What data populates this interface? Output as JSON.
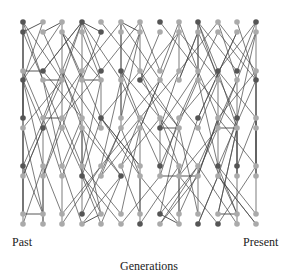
{
  "labels": {
    "past": "Past",
    "present": "Present",
    "axis": "Generations"
  },
  "colors": {
    "dark": "#555555",
    "light": "#aaaaaa",
    "edge": "#444444"
  },
  "columns_x": [
    23,
    43,
    62,
    82,
    101,
    121,
    140,
    160,
    179,
    198,
    218,
    237,
    256
  ],
  "rows_y": [
    22,
    32,
    71,
    80,
    118,
    128,
    166,
    176,
    214,
    224
  ],
  "node_dark": [
    [
      0,
      0
    ],
    [
      0,
      1
    ],
    [
      3,
      0
    ],
    [
      4,
      1
    ],
    [
      7,
      0
    ],
    [
      9,
      0
    ],
    [
      12,
      0
    ],
    [
      1,
      2
    ],
    [
      0,
      3
    ],
    [
      4,
      2
    ],
    [
      5,
      2
    ],
    [
      6,
      3
    ],
    [
      10,
      2
    ],
    [
      11,
      2
    ],
    [
      12,
      3
    ],
    [
      0,
      4
    ],
    [
      1,
      5
    ],
    [
      4,
      4
    ],
    [
      7,
      5
    ],
    [
      9,
      4
    ],
    [
      11,
      4
    ],
    [
      0,
      6
    ],
    [
      3,
      7
    ],
    [
      5,
      7
    ],
    [
      7,
      6
    ],
    [
      10,
      6
    ],
    [
      11,
      6
    ],
    [
      3,
      8
    ],
    [
      7,
      8
    ],
    [
      6,
      9
    ],
    [
      9,
      9
    ],
    [
      10,
      9
    ]
  ],
  "edges_seed": 7,
  "extra_edges": [
    [
      [
        1,
        0
      ],
      [
        0,
        1
      ]
    ],
    [
      [
        2,
        0
      ],
      [
        1,
        1
      ]
    ],
    [
      [
        3,
        0
      ],
      [
        4,
        1
      ]
    ],
    [
      [
        0,
        2
      ],
      [
        1,
        2
      ]
    ],
    [
      [
        1,
        3
      ],
      [
        2,
        3
      ]
    ],
    [
      [
        3,
        3
      ],
      [
        4,
        3
      ]
    ],
    [
      [
        1,
        4
      ],
      [
        2,
        4
      ]
    ],
    [
      [
        7,
        5
      ],
      [
        8,
        5
      ]
    ],
    [
      [
        0,
        8
      ],
      [
        1,
        8
      ]
    ],
    [
      [
        3,
        9
      ],
      [
        4,
        8
      ]
    ],
    [
      [
        7,
        8
      ],
      [
        8,
        9
      ]
    ],
    [
      [
        10,
        8
      ],
      [
        11,
        8
      ]
    ],
    [
      [
        5,
        0
      ],
      [
        6,
        1
      ]
    ],
    [
      [
        7,
        7
      ],
      [
        9,
        7
      ]
    ],
    [
      [
        10,
        5
      ],
      [
        11,
        5
      ]
    ]
  ]
}
